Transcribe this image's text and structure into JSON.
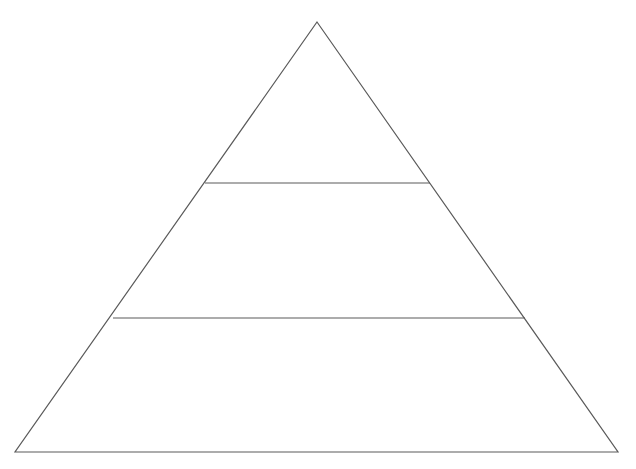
{
  "diagram": {
    "type": "pyramid",
    "tiers": 3,
    "stroke_color": "#5a5a5a",
    "stroke_width": 1.2,
    "background": "#ffffff",
    "apex": [
      317,
      22
    ],
    "base_left": [
      15,
      452
    ],
    "base_right": [
      618,
      452
    ],
    "dividers": [
      {
        "y": 183,
        "x1": 205,
        "x2": 430
      },
      {
        "y": 318,
        "x1": 113,
        "x2": 525
      }
    ],
    "tier_labels": [
      "",
      "",
      ""
    ]
  }
}
